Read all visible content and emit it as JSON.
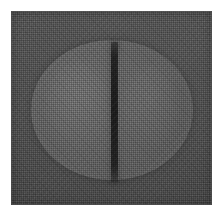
{
  "document": {
    "kind": "scanned-photograph",
    "width": 224,
    "height": 216,
    "background_color": "#ffffff",
    "margin_px": 11,
    "alt_text": "Halftoned grayscale photograph of a round disc-shaped object with a vertical score groove down its center"
  },
  "plate": {
    "label": "scanned photo plate",
    "x": 11,
    "y": 11,
    "width": 201,
    "height": 194,
    "fill_color": "#565656",
    "texture": "crosshatch-halftone-dither",
    "vignette": true
  },
  "subject": {
    "name": "round disc",
    "shape": "circle",
    "center_x": 112,
    "center_y": 110,
    "radius_px": 81,
    "fill_color": "#606060",
    "highlight_color": "#6e6e6e"
  },
  "feature": {
    "name": "vertical score line",
    "orientation": "vertical",
    "x": 114,
    "top_y": 42,
    "bottom_y": 182,
    "thickness_px": 7,
    "color": "#262626"
  },
  "palette": {
    "page": "#ffffff",
    "plate_gray": "#565656",
    "disc_gray": "#606060",
    "groove_dark": "#262626",
    "highlight": "#6e6e6e"
  }
}
